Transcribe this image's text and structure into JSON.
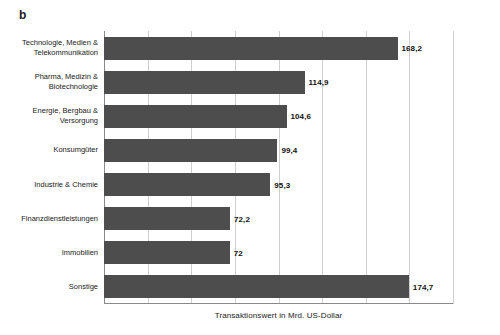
{
  "panel": {
    "label": "b"
  },
  "chart_data": {
    "type": "bar",
    "orientation": "horizontal",
    "title": "",
    "subtitle": "",
    "xlabel": "Transaktionswert in Mrd. US-Dollar",
    "ylabel": "",
    "xlim": [
      0,
      200
    ],
    "xticks": [
      0,
      25,
      50,
      75,
      100,
      125,
      150,
      175,
      200
    ],
    "xtick_labels": [
      "",
      "",
      "",
      "",
      "",
      "",
      "",
      "",
      ""
    ],
    "grid": true,
    "legend": false,
    "legend_position": "none",
    "bar_color": "#4d4d4d",
    "gridline_color": "#cfcfcf",
    "axis_color": "#8a8a8a",
    "categories": [
      "Technologie, Medien & Telekommunikation",
      "Pharma, Medizin & Biotechnologie",
      "Energie, Bergbau & Versorgung",
      "Konsumgüter",
      "Industrie & Chemie",
      "Finanzdienstleistungen",
      "Immobilien",
      "Sonstige"
    ],
    "values": [
      168.2,
      114.9,
      104.6,
      99.4,
      95.3,
      72.2,
      72,
      174.7
    ],
    "value_labels": [
      "168,2",
      "114,9",
      "104,6",
      "99,4",
      "95,3",
      "72,2",
      "72",
      "174,7"
    ],
    "category_lines": [
      [
        "Technologie, Medien &",
        "Telekommunikation"
      ],
      [
        "Pharma, Medizin &",
        "Biotechnologie"
      ],
      [
        "Energie, Bergbau &",
        "Versorgung"
      ],
      [
        "Konsumgüter"
      ],
      [
        "Industrie & Chemie"
      ],
      [
        "Finanzdienstleistungen"
      ],
      [
        "Immobilien"
      ],
      [
        "Sonstige"
      ]
    ]
  }
}
